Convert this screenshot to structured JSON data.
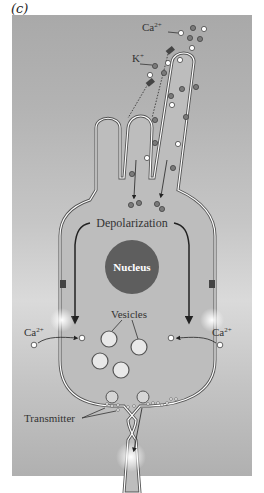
{
  "figure": {
    "panel_label": "(c)",
    "labels": {
      "calcium_top": "Ca",
      "calcium_top_sup": "2+",
      "potassium": "K",
      "potassium_sup": "+",
      "depolarization": "Depolarization",
      "nucleus": "Nucleus",
      "vesicles": "Vesicles",
      "calcium_left": "Ca",
      "calcium_left_sup": "2+",
      "calcium_right": "Ca",
      "calcium_right_sup": "2+",
      "transmitter": "Transmitter"
    },
    "colors": {
      "background_top": "#a9a9a9",
      "background_mid": "#dadada",
      "cell_fill": "#bdbdbd",
      "membrane": "#ffffff",
      "outline": "#555555",
      "nucleus": "#5e5e5e",
      "ion_dark": "#7a7a7a",
      "ion_light": "#ffffff"
    }
  }
}
